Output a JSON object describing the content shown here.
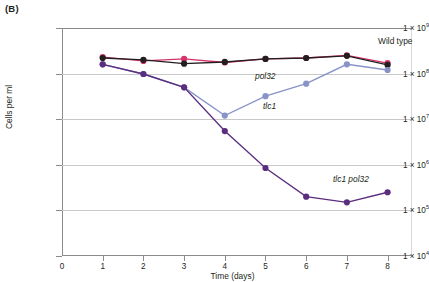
{
  "panel": {
    "label": "(B)"
  },
  "chart_data": {
    "type": "line",
    "title": "",
    "xlabel": "Time (days)",
    "ylabel": "Cells per ml",
    "xlim": [
      0,
      8.6
    ],
    "ylim": [
      10000,
      1000000000
    ],
    "yscale": "log",
    "xscale": "linear",
    "grid": true,
    "legend_position": "inline-annotations",
    "xticks": [
      0,
      1,
      2,
      3,
      4,
      5,
      6,
      7,
      8
    ],
    "xtick_labels": [
      "0",
      "1",
      "2",
      "3",
      "4",
      "5",
      "6",
      "7",
      "8"
    ],
    "yticks": [
      10000,
      100000,
      1000000,
      10000000,
      100000000,
      1000000000
    ],
    "ytick_labels": [
      {
        "mantissa": "1 × 10",
        "exponent": "4"
      },
      {
        "mantissa": "1 × 10",
        "exponent": "5"
      },
      {
        "mantissa": "1 × 10",
        "exponent": "6"
      },
      {
        "mantissa": "1 × 10",
        "exponent": "7"
      },
      {
        "mantissa": "1 × 10",
        "exponent": "8"
      },
      {
        "mantissa": "1 × 10",
        "exponent": "9"
      }
    ],
    "x": [
      1,
      2,
      3,
      4,
      5,
      6,
      7,
      8
    ],
    "series": [
      {
        "name": "Wild type",
        "label": "Wild type",
        "italic": false,
        "color": "#d6336c",
        "marker_color": "#d6336c",
        "values": [
          230000000.0,
          190000000.0,
          210000000.0,
          175000000.0,
          210000000.0,
          220000000.0,
          250000000.0,
          170000000.0
        ]
      },
      {
        "name": "pol32",
        "label": "pol32",
        "italic": true,
        "color": "#231f20",
        "marker_color": "#231f20",
        "values": [
          220000000.0,
          200000000.0,
          165000000.0,
          180000000.0,
          210000000.0,
          220000000.0,
          245000000.0,
          155000000.0
        ]
      },
      {
        "name": "tlc1",
        "label": "tlc1",
        "italic": true,
        "color": "#8893c8",
        "marker_color": "#8893c8",
        "values": [
          160000000.0,
          98000000.0,
          50000000.0,
          12000000.0,
          32000000.0,
          60000000.0,
          160000000.0,
          120000000.0
        ]
      },
      {
        "name": "tlc1 pol32",
        "label": "tlc1 pol32",
        "italic": true,
        "color": "#5b2d7e",
        "marker_color": "#5b2d7e",
        "values": [
          160000000.0,
          98000000.0,
          50000000.0,
          5500000.0,
          850000.0,
          200000.0,
          150000.0,
          250000.0
        ]
      }
    ],
    "annotations": [
      {
        "text": "Wild type",
        "italic": false,
        "x_px": 378,
        "y_px": 36
      },
      {
        "text": "pol32",
        "italic": true,
        "x_px": 255,
        "y_px": 71
      },
      {
        "text": "tlc1",
        "italic": true,
        "x_px": 263,
        "y_px": 101
      },
      {
        "text": "tlc1 pol32",
        "italic": true,
        "x_px": 333,
        "y_px": 174
      }
    ]
  }
}
